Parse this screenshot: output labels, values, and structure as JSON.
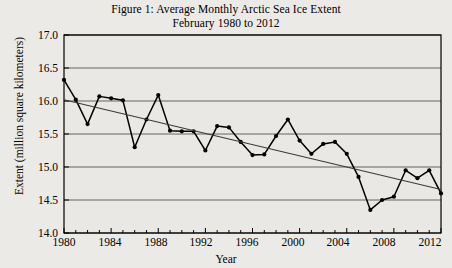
{
  "figure": {
    "title_line1": "Figure 1: Average Monthly Arctic Sea Ice Extent",
    "title_line2": "February 1980 to 2012"
  },
  "axes": {
    "ylabel": "Extent (million square kilometers)",
    "xlabel": "Year",
    "ytick_labels": [
      "17.0",
      "16.5",
      "16.0",
      "15.5",
      "15.0",
      "14.5",
      "14.0"
    ],
    "xtick_labels": [
      "1980",
      "1984",
      "1988",
      "1992",
      "1996",
      "2000",
      "2004",
      "2008",
      "2012"
    ]
  },
  "colors": {
    "background": "#eceae6",
    "plot_background": "#eae8e4",
    "axis": "#000000",
    "grid": "#555555",
    "series": "#000000",
    "trend": "#3a3a3a"
  },
  "chart_data": {
    "type": "line",
    "title": "Figure 1: Average Monthly Arctic Sea Ice Extent February 1980 to 2012",
    "xlabel": "Year",
    "ylabel": "Extent (million square kilometers)",
    "xlim": [
      1980,
      2012
    ],
    "ylim": [
      14.0,
      17.0
    ],
    "yticks": [
      14.0,
      14.5,
      15.0,
      15.5,
      16.0,
      16.5,
      17.0
    ],
    "xticks": [
      1980,
      1984,
      1988,
      1992,
      1996,
      2000,
      2004,
      2008,
      2012
    ],
    "grid": true,
    "legend": "none",
    "markers": true,
    "x": [
      1980,
      1981,
      1982,
      1983,
      1984,
      1985,
      1986,
      1987,
      1988,
      1989,
      1990,
      1991,
      1992,
      1993,
      1994,
      1995,
      1996,
      1997,
      1998,
      1999,
      2000,
      2001,
      2002,
      2003,
      2004,
      2005,
      2006,
      2007,
      2008,
      2009,
      2010,
      2011,
      2012
    ],
    "series": [
      {
        "name": "February Arctic sea ice extent",
        "values": [
          16.32,
          16.02,
          15.65,
          16.07,
          16.04,
          16.01,
          15.3,
          15.72,
          16.09,
          15.55,
          15.54,
          15.54,
          15.25,
          15.62,
          15.6,
          15.38,
          15.18,
          15.19,
          15.47,
          15.72,
          15.4,
          15.2,
          15.35,
          15.38,
          15.2,
          14.85,
          14.35,
          14.5,
          14.55,
          14.95,
          14.83,
          14.95,
          14.6
        ]
      },
      {
        "name": "Linear trend",
        "type": "trendline",
        "endpoints": [
          [
            1980,
            16.02
          ],
          [
            2012,
            14.66
          ]
        ]
      }
    ]
  }
}
